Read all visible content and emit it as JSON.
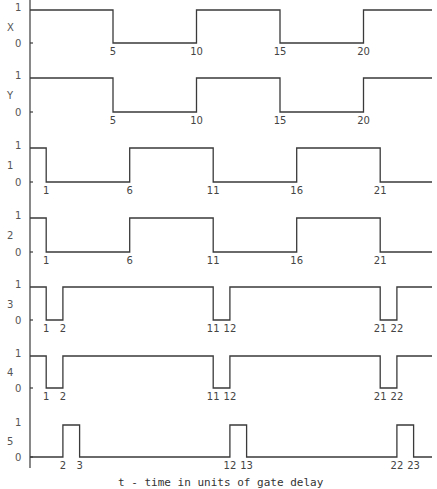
{
  "caption": "t - time in units of gate delay",
  "chart_data": {
    "type": "line",
    "title": "",
    "xlabel": "t - time in units of gate delay",
    "ylabel": "",
    "style": "digital timing diagram (step waveforms)",
    "x_range": [
      0,
      24
    ],
    "level_labels": [
      "0",
      "1"
    ],
    "series": [
      {
        "name": "X",
        "initial": 1,
        "transitions": [
          5,
          10,
          15,
          20
        ],
        "tick_labels": [
          "5",
          "10",
          "15",
          "20"
        ]
      },
      {
        "name": "Y",
        "initial": 1,
        "transitions": [
          5,
          10,
          15,
          20
        ],
        "tick_labels": [
          "5",
          "10",
          "15",
          "20"
        ]
      },
      {
        "name": "1",
        "initial": 1,
        "transitions": [
          1,
          6,
          11,
          16,
          21
        ],
        "tick_labels": [
          "1",
          "6",
          "11",
          "16",
          "21"
        ]
      },
      {
        "name": "2",
        "initial": 1,
        "transitions": [
          1,
          6,
          11,
          16,
          21
        ],
        "tick_labels": [
          "1",
          "6",
          "11",
          "16",
          "21"
        ]
      },
      {
        "name": "3",
        "initial": 1,
        "transitions": [
          1,
          2,
          11,
          12,
          21,
          22
        ],
        "tick_labels": [
          "1",
          "2",
          "11",
          "12",
          "21",
          "22"
        ]
      },
      {
        "name": "4",
        "initial": 1,
        "transitions": [
          1,
          2,
          11,
          12,
          21,
          22
        ],
        "tick_labels": [
          "1",
          "2",
          "11",
          "12",
          "21",
          "22"
        ]
      },
      {
        "name": "5",
        "initial": 0,
        "transitions": [
          2,
          3,
          12,
          13,
          22,
          23
        ],
        "tick_labels": [
          "2",
          "3",
          "12",
          "13",
          "22",
          "23"
        ]
      }
    ]
  },
  "layout": {
    "x0": 29.5,
    "unit_px": 16.7,
    "x_end": 432,
    "axis_x": 30,
    "axis_top": 0,
    "axis_bottom": 468,
    "rows": [
      {
        "high": 10,
        "low": 43
      },
      {
        "high": 78,
        "low": 112
      },
      {
        "high": 148,
        "low": 182
      },
      {
        "high": 218,
        "low": 252
      },
      {
        "high": 287,
        "low": 320
      },
      {
        "high": 356,
        "low": 388
      },
      {
        "high": 425,
        "low": 457
      }
    ]
  }
}
